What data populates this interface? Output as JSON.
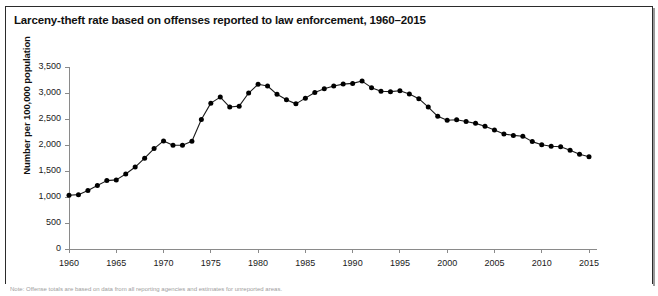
{
  "chart_title": "Larceny-theft rate based on offenses reported to law enforcement, 1960–2015",
  "footnote": "Note: Offense totals are based on data from all reporting agencies and estimates for unreported areas.",
  "axis": {
    "y_title": "Number per 100,000 population",
    "y_ticks": [
      "3,500",
      "3,000",
      "2,500",
      "2,000",
      "1,500",
      "1,000",
      "500",
      "0"
    ],
    "x_ticks": [
      "1960",
      "1965",
      "1970",
      "1975",
      "1980",
      "1985",
      "1990",
      "1995",
      "2000",
      "2005",
      "2010",
      "2015"
    ]
  },
  "colors": {
    "line": "#1a1a1a",
    "marker": "#000000",
    "axis": "#8a8a8a",
    "text": "#111111",
    "frame": "#2b2b2b",
    "background": "#ffffff"
  },
  "chart_data": {
    "type": "line",
    "title": "Larceny-theft rate based on offenses reported to law enforcement, 1960–2015",
    "xlabel": "",
    "ylabel": "Number per 100,000 population",
    "xlim": [
      1960,
      2015
    ],
    "ylim": [
      0,
      3500
    ],
    "ytick_values": [
      0,
      500,
      1000,
      1500,
      2000,
      2500,
      3000,
      3500
    ],
    "xtick_values": [
      1960,
      1965,
      1970,
      1975,
      1980,
      1985,
      1990,
      1995,
      2000,
      2005,
      2010,
      2015
    ],
    "grid": false,
    "legend": "none",
    "markers": "filled-circle",
    "x": [
      1960,
      1961,
      1962,
      1963,
      1964,
      1965,
      1966,
      1967,
      1968,
      1969,
      1970,
      1971,
      1972,
      1973,
      1974,
      1975,
      1976,
      1977,
      1978,
      1979,
      1980,
      1981,
      1982,
      1983,
      1984,
      1985,
      1986,
      1987,
      1988,
      1989,
      1990,
      1991,
      1992,
      1993,
      1994,
      1995,
      1996,
      1997,
      1998,
      1999,
      2000,
      2001,
      2002,
      2003,
      2004,
      2005,
      2006,
      2007,
      2008,
      2009,
      2010,
      2011,
      2012,
      2013,
      2014,
      2015
    ],
    "values": [
      1035,
      1045,
      1124,
      1219,
      1315,
      1329,
      1443,
      1576,
      1747,
      1931,
      2079,
      1994,
      1994,
      2072,
      2490,
      2805,
      2921,
      2730,
      2747,
      2999,
      3167,
      3135,
      2975,
      2869,
      2791,
      2901,
      3010,
      3081,
      3135,
      3171,
      3185,
      3229,
      3103,
      3034,
      3026,
      3043,
      2980,
      2891,
      2729,
      2551,
      2477,
      2486,
      2451,
      2416,
      2362,
      2287,
      2213,
      2185,
      2167,
      2065,
      2005,
      1976,
      1965,
      1901,
      1821,
      1775
    ]
  }
}
